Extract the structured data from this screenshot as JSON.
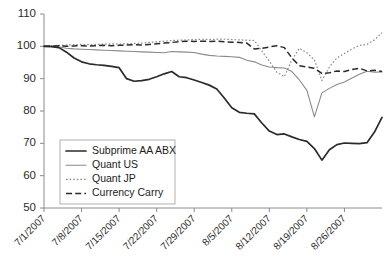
{
  "chart_data": {
    "type": "line",
    "title": "",
    "xlabel": "",
    "ylabel": "",
    "ylim": [
      50,
      110
    ],
    "ytick_labels": [
      "110",
      "100",
      "90",
      "80",
      "70",
      "60",
      "50"
    ],
    "ytick_values": [
      110,
      100,
      90,
      80,
      70,
      60,
      50
    ],
    "grid": false,
    "legend_position": "lower-left-inside",
    "x_tick_labels": [
      "7/1/2007",
      "7/8/2007",
      "7/15/2007",
      "7/22/2007",
      "7/29/2007",
      "8/5/2007",
      "8/12/2007",
      "8/19/2007",
      "8/26/2007"
    ],
    "x_index_range": [
      0,
      45
    ],
    "note": "x axis is business days from 7/1/2007; tick labels every 5 indices (weekly)",
    "series": [
      {
        "name": "Subprime AA ABX",
        "style": "solid-thick-black",
        "color": "#2a2a2a",
        "values": [
          100.0,
          99.9,
          99.6,
          98.2,
          96.4,
          95.2,
          94.6,
          94.3,
          94.1,
          93.8,
          93.4,
          90.0,
          89.2,
          89.4,
          89.8,
          90.6,
          91.5,
          92.2,
          90.6,
          90.3,
          89.6,
          88.8,
          88.0,
          86.8,
          84.0,
          81.0,
          79.6,
          79.3,
          79.1,
          76.3,
          73.8,
          72.7,
          72.9,
          72.0,
          71.2,
          70.6,
          68.4,
          64.8,
          68.0,
          69.6,
          70.1,
          70.0,
          69.9,
          70.2,
          73.5,
          78.0
        ]
      },
      {
        "name": "Quant US",
        "style": "solid-thin-gray",
        "color": "#8a8a8a",
        "values": [
          100.0,
          100.0,
          99.8,
          99.4,
          99.2,
          99.1,
          99.0,
          98.9,
          98.8,
          98.7,
          98.6,
          98.5,
          98.4,
          98.3,
          98.2,
          98.1,
          98.0,
          98.4,
          98.3,
          98.2,
          98.1,
          97.6,
          97.2,
          97.0,
          96.9,
          96.8,
          96.6,
          95.7,
          95.2,
          94.2,
          93.6,
          93.4,
          93.3,
          92.2,
          89.6,
          86.4,
          78.2,
          85.6,
          87.0,
          88.2,
          89.0,
          90.2,
          91.4,
          92.3,
          92.0,
          92.1
        ]
      },
      {
        "name": "Quant JP",
        "style": "dotted-gray",
        "color": "#8a8a8a",
        "values": [
          100.0,
          100.2,
          100.3,
          100.4,
          100.5,
          100.6,
          100.5,
          100.6,
          100.7,
          100.8,
          100.7,
          100.8,
          100.9,
          101.0,
          101.2,
          101.4,
          101.6,
          101.8,
          101.9,
          102.0,
          102.1,
          102.2,
          102.1,
          102.2,
          102.2,
          102.1,
          102.0,
          101.9,
          101.8,
          98.6,
          95.4,
          92.0,
          90.6,
          95.8,
          99.4,
          98.0,
          95.8,
          89.4,
          93.6,
          96.4,
          97.8,
          99.2,
          100.3,
          100.6,
          102.0,
          104.2
        ]
      },
      {
        "name": "Currency Carry",
        "style": "dashed-black",
        "color": "#2a2a2a",
        "values": [
          100.0,
          100.1,
          100.2,
          100.0,
          100.1,
          100.2,
          100.1,
          100.2,
          100.3,
          100.2,
          100.3,
          100.4,
          100.5,
          100.4,
          100.6,
          100.8,
          101.0,
          101.2,
          101.4,
          101.6,
          101.5,
          101.6,
          101.5,
          101.6,
          101.4,
          101.3,
          101.2,
          101.0,
          99.2,
          99.4,
          99.8,
          100.2,
          99.6,
          96.4,
          94.0,
          93.6,
          93.2,
          91.6,
          91.8,
          92.4,
          92.2,
          92.8,
          93.2,
          92.4,
          92.6,
          92.2
        ]
      }
    ]
  },
  "legend": {
    "entries": [
      {
        "label": "Subprime AA ABX"
      },
      {
        "label": "Quant US"
      },
      {
        "label": "Quant JP"
      },
      {
        "label": "Currency Carry"
      }
    ]
  },
  "colors": {
    "series_dark": "#2a2a2a",
    "series_gray": "#8a8a8a",
    "axis": "#8c8c8c",
    "text": "#1c1c1c",
    "background": "#ffffff"
  }
}
